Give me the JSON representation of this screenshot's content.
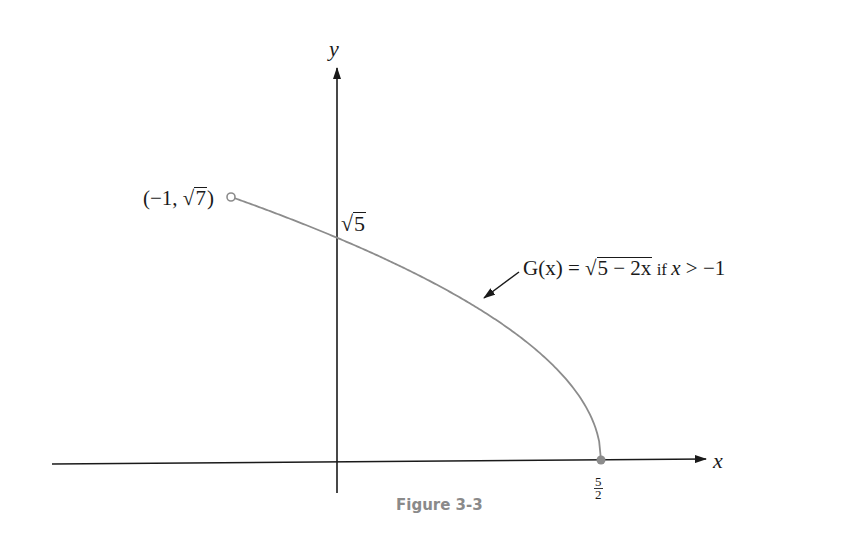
{
  "figure": {
    "caption": "Figure 3-3",
    "x_axis_label": "x",
    "y_axis_label": "y",
    "open_point_label": {
      "prefix": "(−1, ",
      "radical": "7",
      "suffix": ")"
    },
    "y_intercept_label": {
      "radical": "5"
    },
    "x_intercept_label": {
      "numerator": "5",
      "denominator": "2"
    },
    "function_label": {
      "lhs": "G(x) = ",
      "radicand": "5 − 2x",
      "condition_if": " if ",
      "condition_var": "x",
      "condition_rest": " > −1"
    },
    "colors": {
      "axis": "#1a1a1a",
      "curve": "#8c8c8c",
      "caption": "#8a8a8a"
    }
  },
  "chart_data": {
    "type": "line",
    "title": "Figure 3-3",
    "xlabel": "x",
    "ylabel": "y",
    "series": [
      {
        "name": "G(x) = √(5 − 2x) if x > −1",
        "x": [
          -1,
          -0.5,
          0,
          0.5,
          1,
          1.5,
          2,
          2.25,
          2.5
        ],
        "y": [
          2.6458,
          2.4495,
          2.2361,
          2.0,
          1.7321,
          1.4142,
          1.0,
          0.7071,
          0.0
        ]
      }
    ],
    "annotations": [
      {
        "text": "(−1, √7)",
        "x": -1,
        "y": 2.6458,
        "marker": "open circle"
      },
      {
        "text": "√5",
        "x": 0,
        "y": 2.2361
      },
      {
        "text": "5/2",
        "x": 2.5,
        "y": 0,
        "marker": "filled circle"
      }
    ],
    "grid": false,
    "legend": "none"
  }
}
